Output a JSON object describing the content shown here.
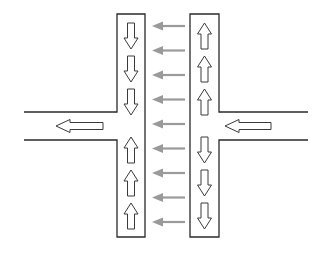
{
  "diagram": {
    "type": "traffic-flow-schematic",
    "left_column": {
      "arrows": [
        "down",
        "down",
        "down",
        "up",
        "up",
        "up"
      ]
    },
    "right_column": {
      "arrows": [
        "up",
        "up",
        "up",
        "down",
        "down",
        "down"
      ]
    },
    "cross_flow": {
      "direction": "left",
      "count": 9,
      "color": "#9a9a9a"
    },
    "left_road": {
      "arrow_direction": "left"
    },
    "right_road": {
      "arrow_direction": "left"
    },
    "colors": {
      "outline": "#2a2a2a",
      "background": "#ffffff"
    }
  }
}
